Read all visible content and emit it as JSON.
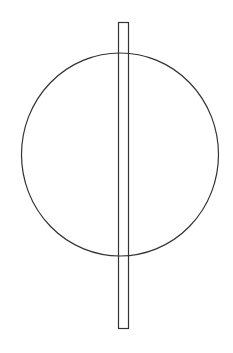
{
  "diagram": {
    "background": "#ffffff",
    "stroke_color": "#333333",
    "shapes": {
      "circle": {
        "cx": 120,
        "cy": 154.5,
        "rx": 98.5,
        "ry": 101.5,
        "stroke_width": 1.2
      },
      "rectangle": {
        "x": 118.5,
        "y": 22.5,
        "width": 10,
        "height": 306,
        "stroke_width": 1.2
      }
    }
  }
}
